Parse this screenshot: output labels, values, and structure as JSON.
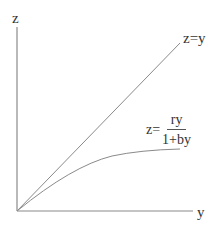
{
  "diagram": {
    "axes": {
      "vertical_label": "z",
      "horizontal_label": "y"
    },
    "curves": [
      {
        "name": "linear",
        "label": "z=y",
        "equation": "z = y",
        "shape": "straight line through origin"
      },
      {
        "name": "saturating",
        "label_prefix": "z=",
        "numerator": "ry",
        "denominator": "1+by",
        "equation": "z = ry/(1+by)",
        "shape": "concave saturating curve through origin"
      }
    ],
    "colors": {
      "lines": "#808080",
      "text": "#333333",
      "background": "#ffffff"
    }
  }
}
